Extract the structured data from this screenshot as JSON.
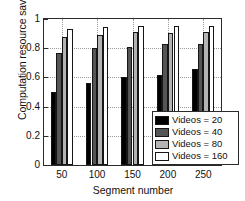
{
  "chart_data": {
    "type": "bar",
    "title": "",
    "xlabel": "Segment number",
    "ylabel": "Computation resource saving",
    "categories": [
      "50",
      "100",
      "150",
      "200",
      "250"
    ],
    "series": [
      {
        "name": "Videos = 20",
        "color": "#000000",
        "values": [
          0.5,
          0.565,
          0.605,
          0.615,
          0.655
        ]
      },
      {
        "name": "Videos = 40",
        "color": "#555555",
        "values": [
          0.765,
          0.8,
          0.81,
          0.83,
          0.83
        ]
      },
      {
        "name": "Videos = 80",
        "color": "#b3b3b3",
        "values": [
          0.88,
          0.89,
          0.91,
          0.905,
          0.91
        ]
      },
      {
        "name": "Videos = 160",
        "color": "#ffffff",
        "values": [
          0.935,
          0.945,
          0.95,
          0.955,
          0.95
        ]
      }
    ],
    "ylim": [
      0,
      1
    ],
    "yticks": [
      "0",
      "0.2",
      "0.4",
      "0.6",
      "0.8",
      "1"
    ],
    "ytick_values": [
      0,
      0.2,
      0.4,
      0.6,
      0.8,
      1
    ],
    "xticks": [
      "50",
      "100",
      "150",
      "200",
      "250"
    ],
    "grid": true,
    "legend_position": "lower-right",
    "legend_entries": [
      "Videos = 20",
      "Videos = 40",
      "Videos = 80",
      "Videos = 160"
    ]
  }
}
